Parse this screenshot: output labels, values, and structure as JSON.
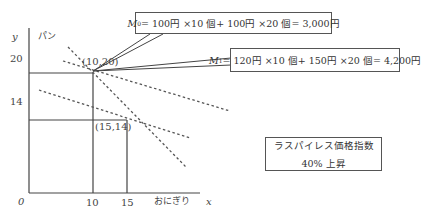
{
  "axes": {
    "y_letter": "y",
    "y_name": "パン",
    "x_letter": "x",
    "x_name": "おにぎり",
    "origin": "0",
    "y_ticks": [
      "20",
      "14"
    ],
    "x_ticks": [
      "10",
      "15"
    ]
  },
  "points": {
    "p0": "(10,20)",
    "p1": "(15,14)"
  },
  "callouts": {
    "m0_label": "M",
    "m0_sub": "0",
    "m0_expr": " = 100円 ×10 個+ 100円 ×20 個= 3,000円",
    "m1_label": "M",
    "m1_sub": "1",
    "m1_expr": " = 120円 ×10 個+ 150円 ×20 個= 4,200円"
  },
  "index_box": {
    "line1": "ラスパイレス価格指数",
    "line2": "40% 上昇"
  },
  "colors": {
    "line": "#444444",
    "dash": "#555555",
    "text": "#333333"
  }
}
